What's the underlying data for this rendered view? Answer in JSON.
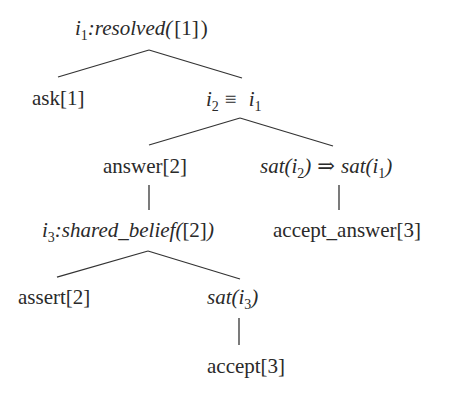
{
  "diagram": {
    "type": "tree",
    "nodes": {
      "root": {
        "var": "i",
        "sub": "1",
        "sep": ":",
        "pred": "resolved(",
        "arg": "[1]",
        "close": ")"
      },
      "ask": {
        "label": "ask[1]"
      },
      "equiv": {
        "left_var": "i",
        "left_sub": "2",
        "symbol": "≡",
        "right_var": "i",
        "right_sub": "1"
      },
      "answer": {
        "label": "answer[2]"
      },
      "sat_impl": {
        "left_fn": "sat(",
        "left_var": "i",
        "left_sub": "2",
        "left_close": ")",
        "symbol": "⇒",
        "right_fn": "sat(",
        "right_var": "i",
        "right_sub": "1",
        "right_close": ")"
      },
      "shared": {
        "var": "i",
        "sub": "3",
        "sep": ":",
        "pred": "shared_belief(",
        "arg": "[2]",
        "close": ")"
      },
      "accept_answer": {
        "label": "accept_answer[3]"
      },
      "assert": {
        "label": "assert[2]"
      },
      "sat3": {
        "fn": "sat(",
        "var": "i",
        "sub": "3",
        "close": ")"
      },
      "accept": {
        "label": "accept[3]"
      }
    },
    "edges": [
      [
        "root",
        "ask"
      ],
      [
        "root",
        "equiv"
      ],
      [
        "equiv",
        "answer"
      ],
      [
        "equiv",
        "sat_impl"
      ],
      [
        "answer",
        "shared"
      ],
      [
        "sat_impl",
        "accept_answer"
      ],
      [
        "shared",
        "assert"
      ],
      [
        "shared",
        "sat3"
      ],
      [
        "sat3",
        "accept"
      ]
    ],
    "line_color": "#333333",
    "text_color": "#2a2a2a"
  }
}
